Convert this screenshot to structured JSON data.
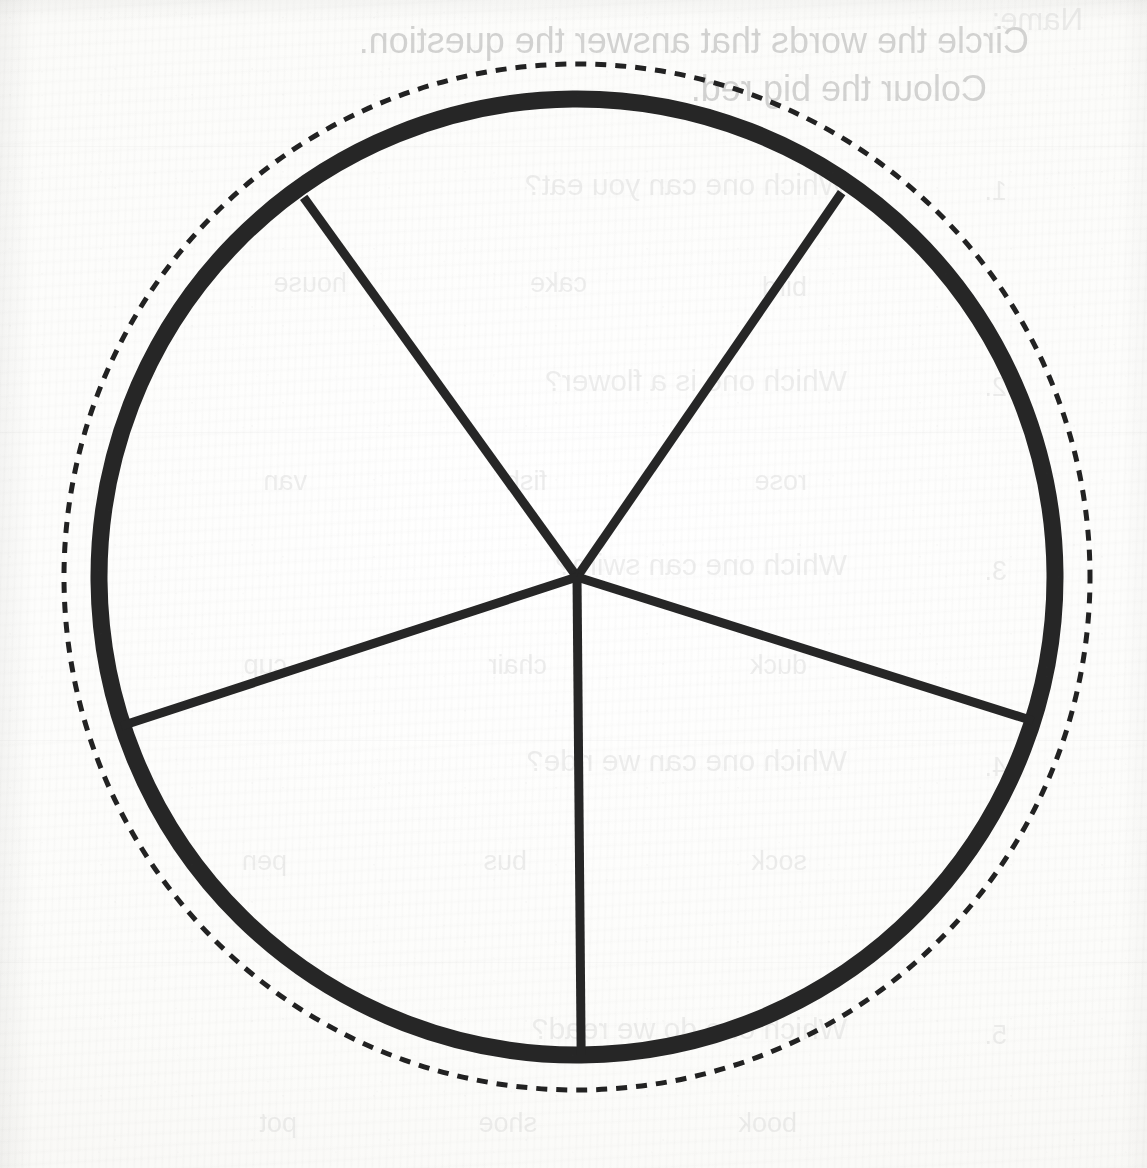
{
  "document": {
    "kind": "scanned-worksheet-page",
    "page_background_color": "#fdfdfc",
    "ink_color": "#262626",
    "caption": ""
  },
  "figure": {
    "name": "circle-divided-into-fifths",
    "center": {
      "x": 577,
      "y": 577
    },
    "solid_circle": {
      "label": "solid-outline-circle",
      "radius": 478,
      "stroke_width": 17,
      "color": "#262626"
    },
    "dashed_circle": {
      "label": "dashed-guide-circle",
      "radius": 513,
      "stroke_width": 5,
      "dash_length": 11,
      "gap_length": 9,
      "color": "#222222"
    },
    "sector_count": 5,
    "radii": [
      {
        "name": "radius-upper-left",
        "angle_deg": 128,
        "end_x": 307,
        "end_y": 195
      },
      {
        "name": "radius-upper-right",
        "angle_deg": 52,
        "end_x": 845,
        "end_y": 195
      },
      {
        "name": "radius-left",
        "angle_deg": 197,
        "end_x": 120,
        "end_y": 722
      },
      {
        "name": "radius-right",
        "angle_deg": 342,
        "end_x": 1032,
        "end_y": 725
      },
      {
        "name": "radius-bottom",
        "angle_deg": 270,
        "end_x": 577,
        "end_y": 1055
      }
    ],
    "radius_stroke_width": 9
  },
  "bleed_through": {
    "note": "Faint mirrored text showing through from the reverse side of the sheet.",
    "lines": [
      {
        "text": "Name:",
        "x": 64,
        "y": 2,
        "size": 31,
        "weight": "faint"
      },
      {
        "text": "Circle the words that answer the question.",
        "x": 118,
        "y": 20,
        "size": 36,
        "weight": "strong"
      },
      {
        "text": "Colour the big red.",
        "x": 160,
        "y": 68,
        "size": 36,
        "weight": "strong"
      },
      {
        "text": "1.",
        "x": 140,
        "y": 176,
        "size": 27,
        "weight": "faint"
      },
      {
        "text": "Which one can you eat?",
        "x": 300,
        "y": 168,
        "size": 30,
        "weight": "faint"
      },
      {
        "text": "bird",
        "x": 340,
        "y": 272,
        "size": 27,
        "weight": "faint"
      },
      {
        "text": "cake",
        "x": 560,
        "y": 268,
        "size": 27,
        "weight": "faint"
      },
      {
        "text": "house",
        "x": 800,
        "y": 268,
        "size": 27,
        "weight": "faint"
      },
      {
        "text": "2.",
        "x": 140,
        "y": 372,
        "size": 27,
        "weight": "faint"
      },
      {
        "text": "Which one is a flower?",
        "x": 300,
        "y": 364,
        "size": 30,
        "weight": "faint"
      },
      {
        "text": "rose",
        "x": 340,
        "y": 466,
        "size": 27,
        "weight": "faint"
      },
      {
        "text": "fish",
        "x": 600,
        "y": 466,
        "size": 27,
        "weight": "faint"
      },
      {
        "text": "van",
        "x": 840,
        "y": 466,
        "size": 27,
        "weight": "faint"
      },
      {
        "text": "3.",
        "x": 140,
        "y": 556,
        "size": 27,
        "weight": "faint"
      },
      {
        "text": "Which one can swim?",
        "x": 300,
        "y": 548,
        "size": 30,
        "weight": "faint"
      },
      {
        "text": "duck",
        "x": 340,
        "y": 650,
        "size": 27,
        "weight": "faint"
      },
      {
        "text": "chair",
        "x": 600,
        "y": 650,
        "size": 27,
        "weight": "faint"
      },
      {
        "text": "cup",
        "x": 860,
        "y": 650,
        "size": 27,
        "weight": "faint"
      },
      {
        "text": "4.",
        "x": 140,
        "y": 752,
        "size": 27,
        "weight": "faint"
      },
      {
        "text": "Which one can we ride?",
        "x": 300,
        "y": 744,
        "size": 30,
        "weight": "faint"
      },
      {
        "text": "sock",
        "x": 340,
        "y": 846,
        "size": 27,
        "weight": "faint"
      },
      {
        "text": "bus",
        "x": 620,
        "y": 846,
        "size": 27,
        "weight": "faint"
      },
      {
        "text": "pen",
        "x": 860,
        "y": 846,
        "size": 27,
        "weight": "faint"
      },
      {
        "text": "5.",
        "x": 140,
        "y": 1020,
        "size": 27,
        "weight": "faint"
      },
      {
        "text": "Which one do we read?",
        "x": 300,
        "y": 1012,
        "size": 30,
        "weight": "faint"
      },
      {
        "text": "book",
        "x": 350,
        "y": 1108,
        "size": 27,
        "weight": "faint"
      },
      {
        "text": "shoe",
        "x": 610,
        "y": 1108,
        "size": 27,
        "weight": "faint"
      },
      {
        "text": "pot",
        "x": 850,
        "y": 1108,
        "size": 27,
        "weight": "faint"
      }
    ],
    "rules": [
      {
        "x": 0,
        "y": 146,
        "width": 1147
      },
      {
        "x": 0,
        "y": 432,
        "width": 1147
      },
      {
        "x": 0,
        "y": 740,
        "width": 1147
      },
      {
        "x": 0,
        "y": 962,
        "width": 1147
      }
    ]
  },
  "chart_data": {
    "type": "pie",
    "title": "",
    "subtitle": "",
    "xlabel": "",
    "ylabel": "",
    "legend_position": "none",
    "grid": false,
    "categories": [
      "Sector 1",
      "Sector 2",
      "Sector 3",
      "Sector 4",
      "Sector 5"
    ],
    "values": [
      20,
      20,
      20,
      20,
      20
    ],
    "value_unit": "percent",
    "fraction_each": "1/5",
    "slice_angle_deg": 72,
    "annotations": [
      "Five equal sectors, each one fifth of the whole circle.",
      "Outer dashed circle is a construction / guide ring.",
      "No sector is shaded; all slices are left blank."
    ],
    "colors": {
      "outline": "#262626",
      "fill": "none",
      "guide": "#222222"
    }
  }
}
